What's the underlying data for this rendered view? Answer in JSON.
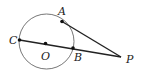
{
  "diagram": {
    "type": "geometry",
    "circle": {
      "center_label": "O",
      "cx": 46.5,
      "cy": 41.5,
      "r": 27.5
    },
    "points": [
      {
        "label": "A",
        "x": 62,
        "y": 21.5,
        "lx": 58,
        "ly": 14
      },
      {
        "label": "C",
        "x": 19.5,
        "y": 40,
        "lx": 9,
        "ly": 43
      },
      {
        "label": "O",
        "x": 45.5,
        "y": 43.5,
        "lx": 41,
        "ly": 58
      },
      {
        "label": "B",
        "x": 73,
        "y": 48,
        "lx": 74,
        "ly": 60
      },
      {
        "label": "P",
        "x": 121,
        "y": 57,
        "lx": 127,
        "ly": 62
      }
    ],
    "segments": [
      {
        "from": "C",
        "to": "P"
      },
      {
        "from": "A",
        "to": "P"
      }
    ],
    "colors": {
      "stroke": "#222222",
      "circle": "#777777"
    }
  }
}
